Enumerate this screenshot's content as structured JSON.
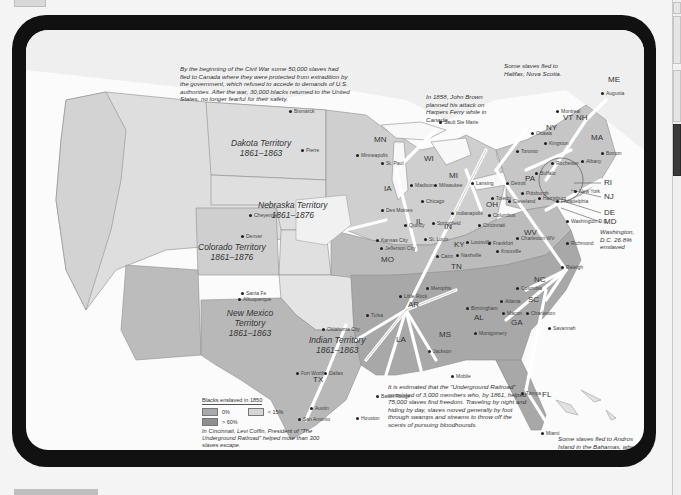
{
  "colors": {
    "frame": "#111111",
    "map_background": "#fbfbfb",
    "canada_land": "#ebebeb",
    "free_territory": "#d6d6d6",
    "slave_low": "#c4c4c4",
    "slave_high": "#a9a9a9",
    "route_arrow": "#ffffff"
  },
  "notes": {
    "canada": "By the beginning of the Civil War some 50,000 slaves had fled to Canada where they were protected from extradition by the government, which refused to accede to demands of U.S. authorities. After the war, 30,000 blacks returned to the United States, no longer fearful for their safety.",
    "john_brown": "In 1858, John Brown planned his attack on Harpers Ferry while in Canada.",
    "halifax": "Some slaves fled to Halifax, Nova Scotia.",
    "washington": "Washington, D.C. 26.8% enslaved",
    "underground": "It is estimated that the \"Underground Railroad\" consisted of 3,000 members who, by 1861, helped 75,000 slaves find freedom. Traveling by night and hiding by day, slaves moved generally by foot through swamps and streams to throw off the scents of pursuing bloodhounds.",
    "andros": "Some slaves fled to Andros Island in the Bahamas, where the British abolished slavery in 1833."
  },
  "territories": [
    {
      "name": "Dakota Territory",
      "years": "1861–1863"
    },
    {
      "name": "Nebraska Territory",
      "years": "1861–1876"
    },
    {
      "name": "Colorado Territory",
      "years": "1861–1876"
    },
    {
      "name": "New Mexico Territory",
      "years": "1861–1863"
    },
    {
      "name": "Indian Territory",
      "years": "1861–1863"
    }
  ],
  "states": [
    "ME",
    "VT",
    "NH",
    "NY",
    "MA",
    "RI",
    "NJ",
    "DE",
    "MD",
    "PA",
    "OH",
    "MI",
    "WI",
    "MN",
    "IA",
    "IL",
    "IN",
    "MO",
    "KY",
    "WV",
    "VA",
    "TN",
    "NC",
    "SC",
    "GA",
    "AL",
    "MS",
    "LA",
    "AR",
    "TX",
    "FL",
    "KS"
  ],
  "cities": [
    "Bismarck",
    "Pierre",
    "Cheyenne",
    "Denver",
    "Santa Fe",
    "Albuquerque",
    "Oklahoma City",
    "Tulsa",
    "Fort Worth",
    "Dallas",
    "Austin",
    "San Antonio",
    "Houston",
    "Baton Rouge",
    "Jackson",
    "Mobile",
    "Montgomery",
    "Birmingham",
    "Little Rock",
    "Memphis",
    "Nashville",
    "Knoxville",
    "Atlanta",
    "Macon",
    "Charleston",
    "Columbia",
    "Savannah",
    "Raleigh",
    "Richmond",
    "Tampa",
    "Miami",
    "Jefferson City",
    "Kansas City",
    "Quincy",
    "Springfield",
    "St. Louis",
    "Cairo",
    "Louisville",
    "Frankfort",
    "Indianapolis",
    "Columbus",
    "Cincinnati",
    "Chicago",
    "Milwaukee",
    "Madison",
    "Minneapolis",
    "St. Paul",
    "Des Moines",
    "Detroit",
    "Lansing",
    "Toledo",
    "Cleveland",
    "Buffalo",
    "Rochester",
    "Albany",
    "Boston",
    "New York",
    "Philadelphia",
    "Harrisburg",
    "Pittsburgh",
    "Washington D.C.",
    "Montreal",
    "Toronto",
    "Kingston",
    "Sault Ste Marie",
    "Ottawa",
    "Charleston WV",
    "Augusta"
  ],
  "bridge_labels": {
    "ri": "RI",
    "nj": "NJ",
    "de": "DE",
    "md": "MD"
  },
  "legend": {
    "title": "Blacks enslaved in 1850",
    "items": [
      {
        "label": "0%",
        "color": "#d6d6d6"
      },
      {
        "label": "< 15%",
        "color": "#c4c4c4"
      },
      {
        "label": "> 60%",
        "color": "#a9a9a9"
      }
    ],
    "note": "In Cincinnati, Levi Coffin, President of \"The Underground Railroad\" helped more than 300 slaves escape."
  }
}
